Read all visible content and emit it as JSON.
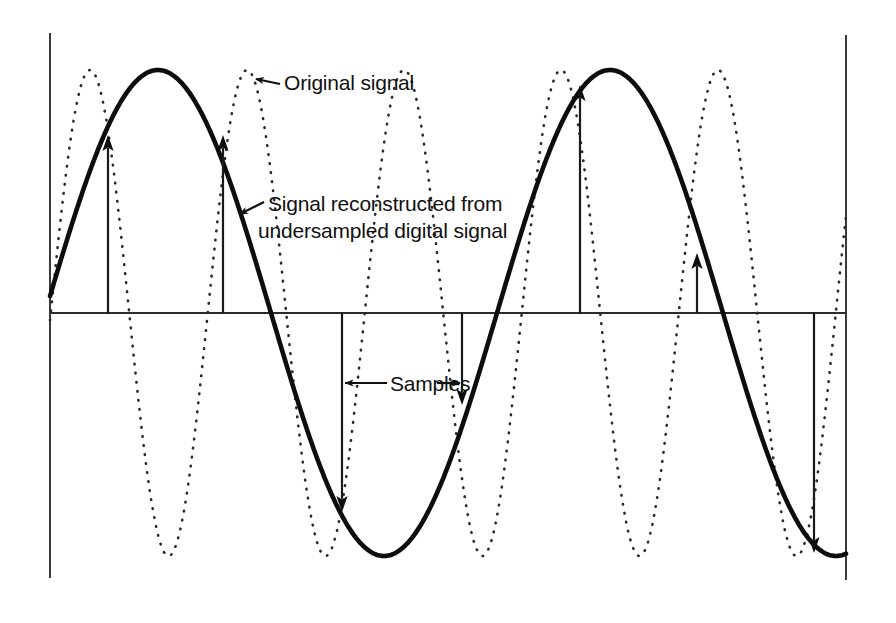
{
  "figure": {
    "background_color": "#ffffff",
    "ink_color": "#111111",
    "axis_color": "#333333",
    "annotations": [
      {
        "id": "original-signal",
        "label": "Original signal",
        "lines": [
          "Original signal"
        ],
        "text_x": 278,
        "text_y": 90,
        "arrow_from_x": 278,
        "arrow_from_y": 83,
        "arrow_to_x": 255,
        "arrow_to_y": 78
      },
      {
        "id": "reconstructed-signal",
        "label": "Signal reconstructed from undersampled digital signal",
        "lines": [
          "Signal reconstructed from",
          "undersampled digital signal"
        ],
        "text_x": 261,
        "text_y": 211,
        "line_height": 27,
        "arrow_from_x": 262,
        "arrow_from_y": 203,
        "arrow_to_x": 238,
        "arrow_to_y": 214
      },
      {
        "id": "samples",
        "label": "Samples",
        "lines": [
          "Samples"
        ],
        "text_x": 385,
        "text_y": 390,
        "left_arrow_from_x": 385,
        "left_arrow_to_x": 343,
        "right_arrow_from_x": 438,
        "right_arrow_to_x": 461,
        "arrow_y": 383
      }
    ]
  },
  "chart_data": {
    "type": "line",
    "title": "",
    "subtitle": "",
    "xlabel": "",
    "ylabel": "",
    "grid": false,
    "legend_position": "inline-annotations",
    "axes": {
      "left_axis_x": 50,
      "right_axis_x": 846,
      "zero_line_y": 313,
      "top_y": 33,
      "bottom_y": 579,
      "amplitude_px": 243
    },
    "series": [
      {
        "name": "Original signal",
        "style": "dotted",
        "period_px": 157,
        "phase_px": 90,
        "amplitude_px": 243,
        "description": "High-frequency sine wave, dotted line, 5 full cycles across the plot",
        "peaks_x": [
          90,
          247,
          404,
          561,
          718,
          875
        ],
        "troughs_x": [
          168,
          325,
          482,
          640,
          798
        ]
      },
      {
        "name": "Signal reconstructed from undersampled digital signal",
        "style": "solid",
        "period_px": 452,
        "phase_px": 158,
        "amplitude_px": 243,
        "description": "Low-frequency alias sine wave, heavy solid line, about 1.75 cycles across the plot",
        "peaks_x": [
          158,
          610
        ],
        "troughs_x": [
          385,
          840
        ]
      }
    ],
    "samples": [
      {
        "index": 1,
        "x": 108,
        "value_px": 178,
        "direction": "up"
      },
      {
        "index": 2,
        "x": 223,
        "value_px": 178,
        "direction": "up"
      },
      {
        "index": 3,
        "x": 342,
        "value_px": -199,
        "direction": "down"
      },
      {
        "index": 4,
        "x": 462,
        "value_px": -92,
        "direction": "down"
      },
      {
        "index": 5,
        "x": 580,
        "value_px": 228,
        "direction": "up"
      },
      {
        "index": 6,
        "x": 697,
        "value_px": 60,
        "direction": "up"
      },
      {
        "index": 7,
        "x": 814,
        "value_px": -240,
        "direction": "down"
      }
    ],
    "sample_interval_px": 118
  }
}
